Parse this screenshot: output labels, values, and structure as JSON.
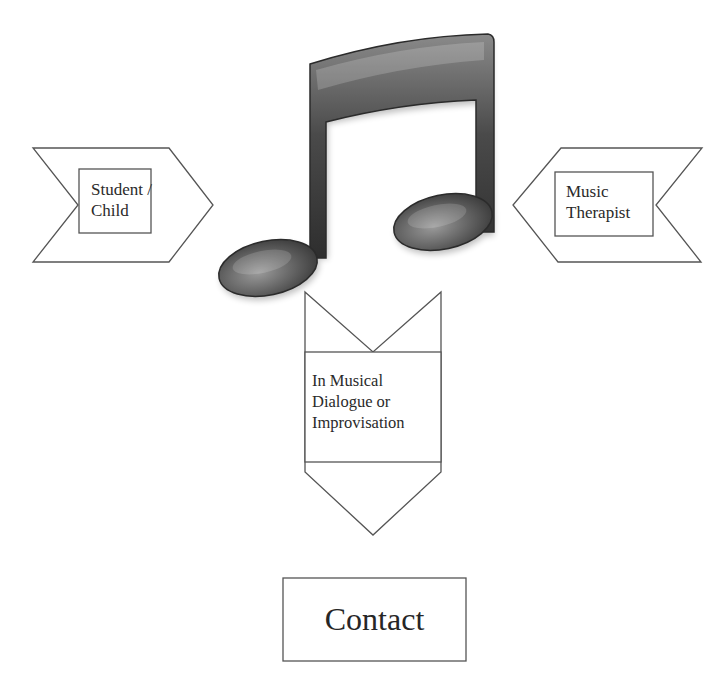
{
  "diagram": {
    "left_node": {
      "lines": [
        "Student /",
        "Child"
      ]
    },
    "right_node": {
      "lines": [
        "Music",
        "Therapist"
      ]
    },
    "center_icon": "music-note-icon",
    "middle_node": {
      "lines": [
        "In Musical",
        "Dialogue or",
        "Improvisation"
      ]
    },
    "bottom_node": {
      "label": "Contact"
    }
  },
  "colors": {
    "stroke": "#555555",
    "note_dark": "#3a3a3a",
    "note_mid": "#6e6e6e",
    "note_light": "#bdbdbd",
    "background": "#ffffff"
  }
}
